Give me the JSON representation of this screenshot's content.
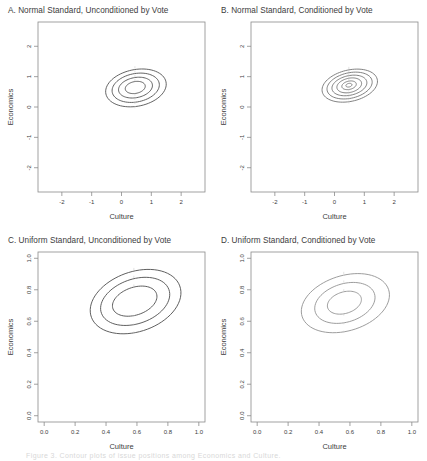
{
  "figure": {
    "background": "#ffffff",
    "axis_color": "#8a8a8a",
    "contour_color": "#4a4a4a",
    "contour_color_light": "#9a9a9a",
    "text_color": "#3c3c3c",
    "bottom_caption": "Figure 3. Contour plots of issue positions among Economics and Culture."
  },
  "chart_data": [
    {
      "id": "A",
      "type": "contour",
      "title": "A. Normal Standard, Unconditioned by Vote",
      "xlabel": "Culture",
      "ylabel": "Economics",
      "xticks": [
        "-2",
        "-1",
        "0",
        "1",
        "2"
      ],
      "xtick_values": [
        -2,
        -1,
        0,
        1,
        2
      ],
      "yticks": [
        "2",
        "1",
        "0",
        "-1",
        "-2"
      ],
      "ytick_values": [
        2,
        1,
        0,
        -1,
        -2
      ],
      "xlim": [
        -2.8,
        2.8
      ],
      "ylim": [
        -2.8,
        2.8
      ],
      "grid": false,
      "legend": "none",
      "peak": {
        "x": 0.45,
        "y": 0.65
      },
      "contours": [
        {
          "level": 0.02,
          "rx": 1.0,
          "ry": 0.62,
          "rotation": -10,
          "stroke": "#4a4a4a"
        },
        {
          "level": 0.05,
          "rx": 0.78,
          "ry": 0.48,
          "rotation": -10,
          "stroke": "#4a4a4a"
        },
        {
          "level": 0.1,
          "rx": 0.56,
          "ry": 0.34,
          "rotation": -10,
          "stroke": "#4a4a4a"
        },
        {
          "level": 0.15,
          "rx": 0.33,
          "ry": 0.2,
          "rotation": -10,
          "stroke": "#4a4a4a"
        }
      ]
    },
    {
      "id": "B",
      "type": "contour",
      "title": "B. Normal Standard, Conditioned by Vote",
      "xlabel": "Culture",
      "ylabel": "Economics",
      "xticks": [
        "-2",
        "-1",
        "0",
        "1",
        "2"
      ],
      "xtick_values": [
        -2,
        -1,
        0,
        1,
        2
      ],
      "yticks": [
        "2",
        "1",
        "0",
        "-1",
        "-2"
      ],
      "ytick_values": [
        2,
        1,
        0,
        -1,
        -2
      ],
      "xlim": [
        -2.8,
        2.8
      ],
      "ylim": [
        -2.8,
        2.8
      ],
      "grid": false,
      "legend": "none",
      "peak": {
        "x": 0.48,
        "y": 0.72
      },
      "contours": [
        {
          "level": 0.02,
          "rx": 0.92,
          "ry": 0.53,
          "rotation": -12,
          "stroke": "#6e6e6e"
        },
        {
          "level": 0.05,
          "rx": 0.75,
          "ry": 0.43,
          "rotation": -12,
          "stroke": "#6e6e6e"
        },
        {
          "level": 0.1,
          "rx": 0.58,
          "ry": 0.33,
          "rotation": -12,
          "stroke": "#6e6e6e"
        },
        {
          "level": 0.15,
          "rx": 0.41,
          "ry": 0.24,
          "rotation": -12,
          "stroke": "#6e6e6e"
        },
        {
          "level": 0.2,
          "rx": 0.24,
          "ry": 0.14,
          "rotation": -12,
          "stroke": "#6e6e6e"
        },
        {
          "level": 0.25,
          "rx": 0.1,
          "ry": 0.06,
          "rotation": -12,
          "stroke": "#6e6e6e"
        }
      ]
    },
    {
      "id": "C",
      "type": "contour",
      "title": "C. Uniform Standard, Unconditioned by Vote",
      "xlabel": "Culture",
      "ylabel": "Economics",
      "xticks": [
        "0.0",
        "0.2",
        "0.4",
        "0.6",
        "0.8",
        "1.0"
      ],
      "xtick_values": [
        0.0,
        0.2,
        0.4,
        0.6,
        0.8,
        1.0
      ],
      "yticks": [
        "1.0",
        "0.8",
        "0.6",
        "0.4",
        "0.2",
        "0.0"
      ],
      "ytick_values": [
        1.0,
        0.8,
        0.6,
        0.4,
        0.2,
        0.0
      ],
      "xlim": [
        -0.04,
        1.04
      ],
      "ylim": [
        -0.04,
        1.04
      ],
      "grid": false,
      "legend": "none",
      "peak": {
        "x": 0.58,
        "y": 0.73
      },
      "contours": [
        {
          "level": 1.0,
          "rx": 0.295,
          "ry": 0.195,
          "rotation": -18,
          "stroke": "#4a4a4a"
        },
        {
          "level": 2.0,
          "rx": 0.225,
          "ry": 0.145,
          "rotation": -18,
          "stroke": "#4a4a4a"
        },
        {
          "level": 3.0,
          "rx": 0.145,
          "ry": 0.09,
          "rotation": -18,
          "stroke": "#4a4a4a"
        }
      ]
    },
    {
      "id": "D",
      "type": "contour",
      "title": "D. Uniform Standard, Conditioned by Vote",
      "xlabel": "Culture",
      "ylabel": "Economics",
      "xticks": [
        "0.0",
        "0.2",
        "0.4",
        "0.6",
        "0.8",
        "1.0"
      ],
      "xtick_values": [
        0.0,
        0.2,
        0.4,
        0.6,
        0.8,
        1.0
      ],
      "yticks": [
        "1.0",
        "0.8",
        "0.6",
        "0.4",
        "0.2",
        "0.0"
      ],
      "ytick_values": [
        1.0,
        0.8,
        0.6,
        0.4,
        0.2,
        0.0
      ],
      "xlim": [
        -0.04,
        1.04
      ],
      "ylim": [
        -0.04,
        1.04
      ],
      "grid": false,
      "legend": "none",
      "peak": {
        "x": 0.56,
        "y": 0.72
      },
      "contours": [
        {
          "level": 1.0,
          "rx": 0.285,
          "ry": 0.18,
          "rotation": -16,
          "stroke": "#8f8f8f"
        },
        {
          "level": 2.0,
          "rx": 0.195,
          "ry": 0.125,
          "rotation": -16,
          "stroke": "#8f8f8f"
        },
        {
          "level": 3.0,
          "rx": 0.11,
          "ry": 0.07,
          "rotation": -16,
          "stroke": "#8f8f8f"
        }
      ]
    }
  ]
}
